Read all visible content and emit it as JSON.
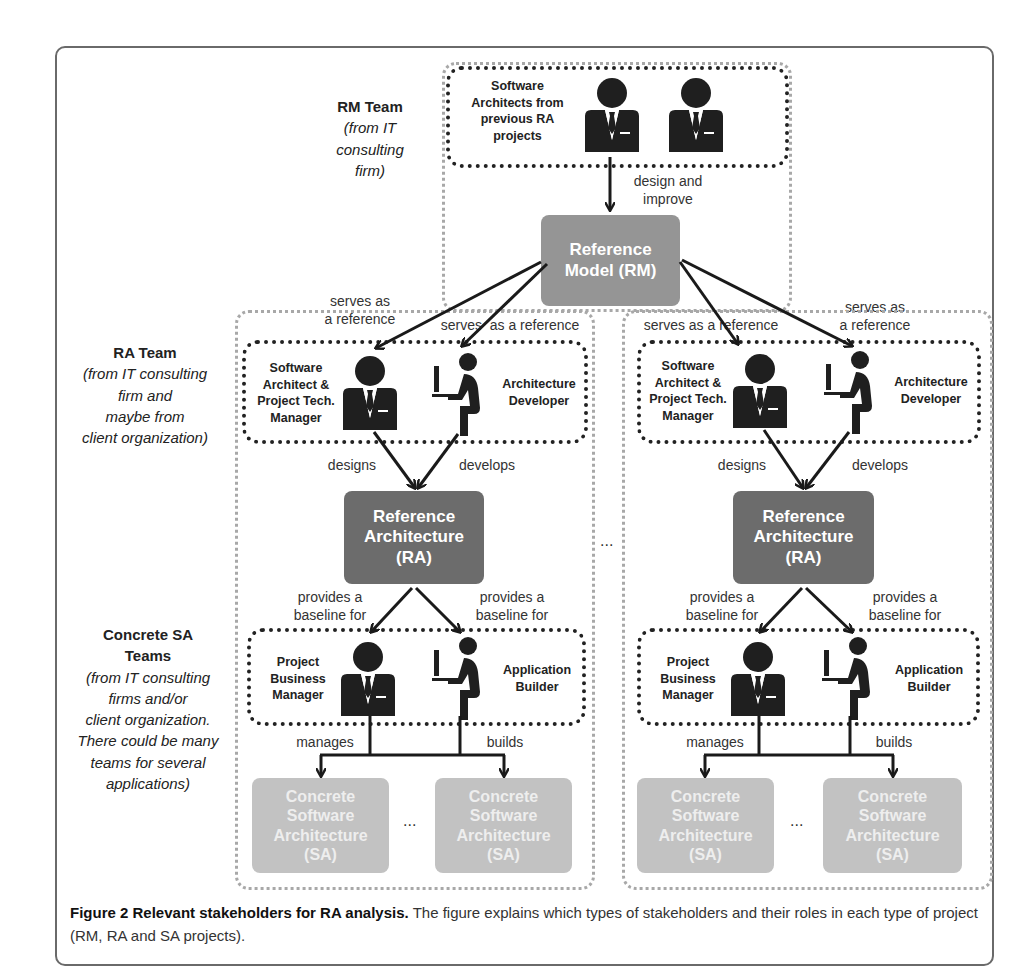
{
  "figure": {
    "caption_title": "Figure 2 Relevant stakeholders for RA analysis.",
    "caption_text": " The figure explains which types of stakeholders and their roles in each type of project (RM, RA and SA projects)."
  },
  "side_labels": {
    "rm_team": {
      "title": "RM Team",
      "note_lines": [
        "(from IT",
        "consulting",
        "firm)"
      ]
    },
    "ra_team": {
      "title": "RA Team",
      "note_lines": [
        "(from IT consulting",
        "firm and",
        "maybe from",
        "client organization)"
      ]
    },
    "sa_teams": {
      "title_lines": [
        "Concrete SA",
        "Teams"
      ],
      "note_lines": [
        "(from IT consulting",
        "firms and/or",
        "client organization.",
        "There could be many",
        "teams for several",
        "applications)"
      ]
    }
  },
  "rm": {
    "team_label_lines": [
      "Software",
      "Architects from",
      "previous RA",
      "projects"
    ],
    "arrow_label_lines": [
      "design and",
      "improve"
    ],
    "box_lines": [
      "Reference",
      "Model (RM)"
    ]
  },
  "serves_labels": {
    "far_left_lines": [
      "serves as",
      "a reference"
    ],
    "inner_left": "serves  as a reference",
    "inner_right": "serves as a reference",
    "far_right_lines": [
      "serves as",
      "a reference"
    ]
  },
  "ra_projects": [
    {
      "architect_lines": [
        "Software",
        "Architect &",
        "Project Tech.",
        "Manager"
      ],
      "developer_lines": [
        "Architecture",
        "Developer"
      ],
      "designs": "designs",
      "develops": "develops",
      "ra_box_lines": [
        "Reference",
        "Architecture",
        "(RA)"
      ],
      "baseline_left_lines": [
        "provides a",
        "baseline for"
      ],
      "baseline_right_lines": [
        "provides a",
        "baseline for"
      ],
      "manager_lines": [
        "Project",
        "Business",
        "Manager"
      ],
      "builder_lines": [
        "Application",
        "Builder"
      ],
      "manages": "manages",
      "builds": "builds",
      "sa_box_lines": [
        "Concrete",
        "Software",
        "Architecture",
        "(SA)"
      ],
      "ellipsis": "..."
    },
    {
      "architect_lines": [
        "Software",
        "Architect &",
        "Project Tech.",
        "Manager"
      ],
      "developer_lines": [
        "Architecture",
        "Developer"
      ],
      "designs": "designs",
      "develops": "develops",
      "ra_box_lines": [
        "Reference",
        "Architecture",
        "(RA)"
      ],
      "baseline_left_lines": [
        "provides a",
        "baseline for"
      ],
      "baseline_right_lines": [
        "provides a",
        "baseline for"
      ],
      "manager_lines": [
        "Project",
        "Business",
        "Manager"
      ],
      "builder_lines": [
        "Application",
        "Builder"
      ],
      "manages": "manages",
      "builds": "builds",
      "sa_box_lines": [
        "Concrete",
        "Software",
        "Architecture",
        "(SA)"
      ],
      "ellipsis": "..."
    }
  ],
  "between_projects_ellipsis": "...",
  "colors": {
    "rm_box": "#959595",
    "ra_box": "#6c6c6c",
    "sa_box": "#c2c2c2",
    "icon": "#1f1f1f"
  }
}
